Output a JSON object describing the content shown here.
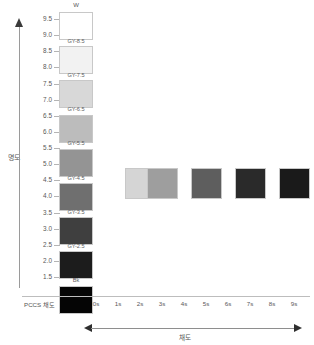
{
  "axes": {
    "vertical": {
      "label": "명도",
      "arrow_icon": "arrow-up-icon",
      "ticks": [
        "9.5",
        "9.0",
        "8.5",
        "8.0",
        "7.5",
        "7.0",
        "6.5",
        "6.0",
        "5.5",
        "5.0",
        "4.5",
        "4.0",
        "3.5",
        "3.0",
        "2.5",
        "2.0",
        "1.5"
      ],
      "range": [
        1.5,
        9.5
      ],
      "step": 0.5
    },
    "horizontal": {
      "name": "PCCS 채도",
      "label": "채도",
      "ticks": [
        "0s",
        "1s",
        "2s",
        "3s",
        "4s",
        "5s",
        "6s",
        "7s",
        "8s",
        "9s"
      ],
      "arrow_left_icon": "arrow-left-icon",
      "arrow_right_icon": "arrow-right-icon"
    }
  },
  "gray_scale": {
    "top_label": "W",
    "swatches": [
      {
        "label": "W",
        "caption": "",
        "color": "#ffffff",
        "value": 9.5
      },
      {
        "label": "GY-8.5",
        "caption": "GY-8.5",
        "color": "#f2f2f2",
        "value": 8.5
      },
      {
        "label": "GY-7.5",
        "caption": "GY-7.5",
        "color": "#d8d8d8",
        "value": 7.5
      },
      {
        "label": "GY-6.5",
        "caption": "GY-6.5",
        "color": "#bcbcbc",
        "value": 6.5
      },
      {
        "label": "GY-5.5",
        "caption": "GY-5.5",
        "color": "#949494",
        "value": 5.5
      },
      {
        "label": "GY-4.5",
        "caption": "GY-4.5",
        "color": "#6f6f6f",
        "value": 4.5
      },
      {
        "label": "GY-3.5",
        "caption": "GY-3.5",
        "color": "#3f3f3f",
        "value": 3.5
      },
      {
        "label": "GY-2.5",
        "caption": "GY-2.5",
        "color": "#1c1c1c",
        "value": 2.5
      },
      {
        "label": "Bk",
        "caption": "Bk",
        "color": "#050505",
        "value": 1.5
      }
    ]
  },
  "chroma_row": {
    "lightness": 4.5,
    "swatches": [
      {
        "label": "2s",
        "color": "#d5d5d5",
        "chroma": 2
      },
      {
        "label": "3s",
        "color": "#9e9e9e",
        "chroma": 3
      },
      {
        "label": "5s",
        "color": "#5e5e5e",
        "chroma": 5
      },
      {
        "label": "7s",
        "color": "#2a2a2a",
        "chroma": 7
      },
      {
        "label": "9s",
        "color": "#1a1a1a",
        "chroma": 9
      }
    ]
  },
  "palette": {
    "axis_line": "#9a9a9a",
    "tick_text": "#585858",
    "swatch_border": "#c8c8c8",
    "background": "#ffffff"
  }
}
